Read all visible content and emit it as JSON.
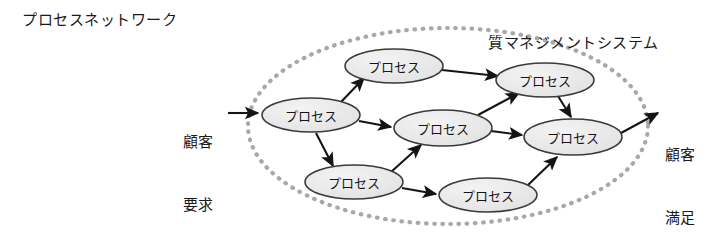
{
  "diagram": {
    "title": "プロセスネットワーク",
    "boundary_label": "質マネジメントシステム",
    "input_label_line1": "顧客",
    "input_label_line2": "要求",
    "output_label_line1": "顧客",
    "output_label_line2": "満足",
    "node_label": "プロセス",
    "colors": {
      "node_fill": "#e9e9e9",
      "node_stroke": "#3a3a3a",
      "boundary_dots": "#a8a8a8",
      "arrow": "#141414",
      "text": "#141414",
      "background": "#ffffff"
    },
    "boundary": {
      "shape": "ellipse",
      "cx": 448,
      "cy": 126,
      "rx": 200,
      "ry": 98,
      "stroke_style": "dotted"
    },
    "nodes": [
      {
        "id": "p1",
        "label": "プロセス",
        "cx": 311,
        "cy": 115,
        "rx": 49,
        "ry": 17
      },
      {
        "id": "p2",
        "label": "プロセス",
        "cx": 394,
        "cy": 66,
        "rx": 49,
        "ry": 17
      },
      {
        "id": "p3",
        "label": "プロセス",
        "cx": 443,
        "cy": 128,
        "rx": 49,
        "ry": 18
      },
      {
        "id": "p4",
        "label": "プロセス",
        "cx": 545,
        "cy": 80,
        "rx": 49,
        "ry": 17
      },
      {
        "id": "p5",
        "label": "プロセス",
        "cx": 573,
        "cy": 137,
        "rx": 49,
        "ry": 18
      },
      {
        "id": "p6",
        "label": "プロセス",
        "cx": 354,
        "cy": 182,
        "rx": 49,
        "ry": 17
      },
      {
        "id": "p7",
        "label": "プロセス",
        "cx": 488,
        "cy": 195,
        "rx": 49,
        "ry": 17
      }
    ],
    "edges": [
      {
        "from": "input",
        "to": "p1"
      },
      {
        "from": "p1",
        "to": "p2"
      },
      {
        "from": "p1",
        "to": "p3"
      },
      {
        "from": "p1",
        "to": "p6"
      },
      {
        "from": "p2",
        "to": "p4"
      },
      {
        "from": "p3",
        "to": "p4"
      },
      {
        "from": "p3",
        "to": "p5"
      },
      {
        "from": "p4",
        "to": "p5"
      },
      {
        "from": "p6",
        "to": "p3"
      },
      {
        "from": "p6",
        "to": "p7"
      },
      {
        "from": "p7",
        "to": "p5"
      },
      {
        "from": "p5",
        "to": "output"
      }
    ]
  }
}
